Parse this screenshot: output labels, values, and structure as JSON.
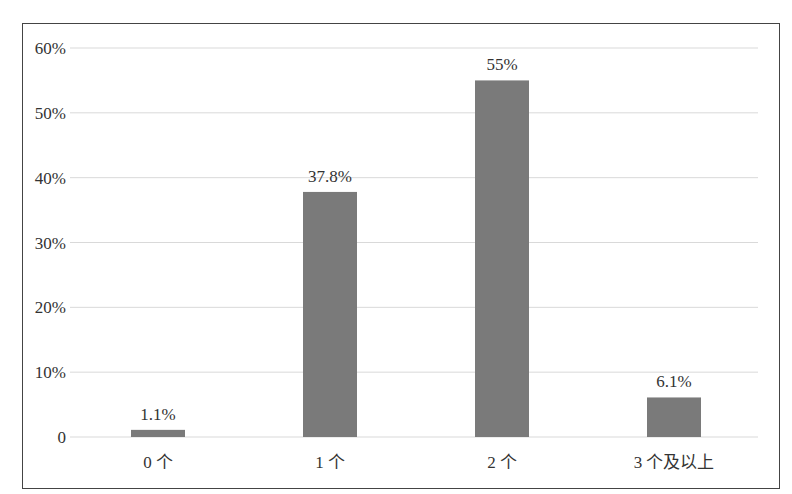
{
  "chart_data": {
    "type": "bar",
    "title": "",
    "xlabel": "",
    "ylabel": "",
    "categories": [
      "0 个",
      "1 个",
      "2 个",
      "3 个及以上"
    ],
    "values": [
      1.1,
      37.8,
      55,
      6.1
    ],
    "data_labels": [
      "1.1%",
      "37.8%",
      "55%",
      "6.1%"
    ],
    "ylim": [
      0,
      60
    ],
    "yticks": [
      0,
      10,
      20,
      30,
      40,
      50,
      60
    ],
    "ytick_labels": [
      "0",
      "10%",
      "20%",
      "30%",
      "40%",
      "50%",
      "60%"
    ],
    "grid": true,
    "legend": "none",
    "bar_color": "#7a7a7a",
    "grid_color": "#d9d9d9"
  }
}
